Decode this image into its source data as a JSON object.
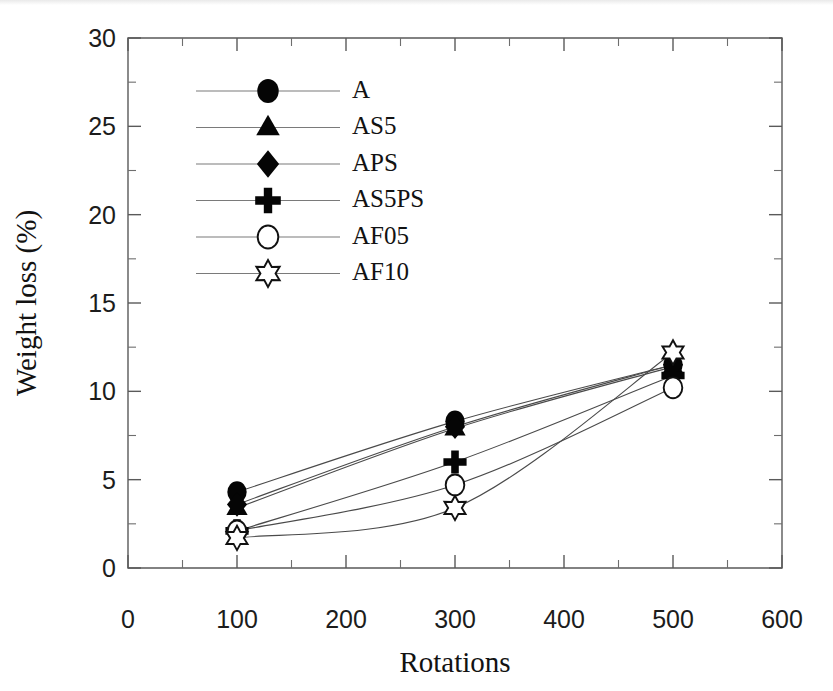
{
  "chart_data": {
    "type": "line",
    "title": "",
    "xlabel": "Rotations",
    "ylabel": "Weight loss (%)",
    "xlim": [
      0,
      600
    ],
    "ylim": [
      0,
      30
    ],
    "x_ticks": [
      0,
      100,
      200,
      300,
      400,
      500,
      600
    ],
    "y_ticks": [
      0,
      5,
      10,
      15,
      20,
      25,
      30
    ],
    "x_tick_labels": [
      "0",
      "100",
      "200",
      "300",
      "400",
      "500",
      "600"
    ],
    "y_tick_labels": [
      "0",
      "5",
      "10",
      "15",
      "20",
      "25",
      "30"
    ],
    "x_minor_interval": 50,
    "y_minor_interval": 2.5,
    "grid": false,
    "legend_position": "upper-left-inside",
    "x": [
      100,
      300,
      500
    ],
    "series": [
      {
        "name": "A",
        "marker": "filled-circle",
        "values": [
          4.3,
          8.3,
          11.5
        ]
      },
      {
        "name": "AS5",
        "marker": "filled-triangle",
        "values": [
          3.4,
          7.9,
          11.4
        ]
      },
      {
        "name": "APS",
        "marker": "filled-diamond",
        "values": [
          3.6,
          8.0,
          11.5
        ]
      },
      {
        "name": "AS5PS",
        "marker": "plus",
        "values": [
          2.1,
          6.0,
          10.9
        ]
      },
      {
        "name": "AF05",
        "marker": "open-circle",
        "values": [
          2.1,
          4.7,
          10.2
        ]
      },
      {
        "name": "AF10",
        "marker": "open-star",
        "values": [
          1.7,
          3.4,
          12.2
        ]
      }
    ],
    "colors": {
      "marker": "#050505",
      "line": "#4a4a4a",
      "axis": "#5a5a5a",
      "text": "#121212"
    }
  },
  "legend": {
    "entries": [
      {
        "label": "A",
        "marker": "filled-circle"
      },
      {
        "label": "AS5",
        "marker": "filled-triangle"
      },
      {
        "label": "APS",
        "marker": "filled-diamond"
      },
      {
        "label": "AS5PS",
        "marker": "plus"
      },
      {
        "label": "AF05",
        "marker": "open-circle"
      },
      {
        "label": "AF10",
        "marker": "open-star"
      }
    ]
  }
}
